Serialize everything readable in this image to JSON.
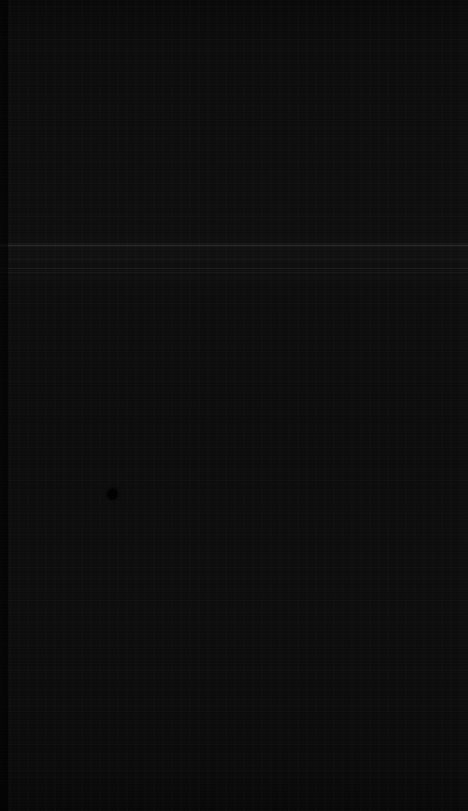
{
  "capture": {
    "width_px": 468,
    "height_px": 811,
    "description": "Near-black screen capture with no legible content",
    "state_label": "",
    "background_color": "#0b0b0b"
  },
  "colors": {
    "background": "#0b0b0b",
    "surface_dark": "#090909",
    "surface_mid": "#0d0d0d",
    "surface_light_band": "#141414",
    "rule_faint": "#1c1c1c",
    "rule_fainter": "#151515",
    "cursor": "#020202",
    "edge_gutter": "#000000"
  },
  "features": {
    "left_gutter": {
      "x": 0,
      "width": 8,
      "label": ""
    },
    "right_edge_band": {
      "x": 461,
      "width": 7,
      "label": ""
    },
    "bright_band": {
      "y": 243,
      "height": 5,
      "label": ""
    },
    "rules": [
      {
        "y": 245,
        "height": 1,
        "color": "#1e1e1e",
        "label": ""
      },
      {
        "y": 268,
        "height": 1,
        "color": "#1a1a1a",
        "label": ""
      },
      {
        "y": 272,
        "height": 1,
        "color": "#181818",
        "label": ""
      },
      {
        "y": 276,
        "height": 1,
        "color": "#131313",
        "label": ""
      },
      {
        "y": 388,
        "height": 1,
        "color": "#111111",
        "label": ""
      },
      {
        "y": 670,
        "height": 1,
        "color": "#121212",
        "label": ""
      },
      {
        "y": 706,
        "height": 1,
        "color": "#111111",
        "label": ""
      },
      {
        "y": 770,
        "height": 1,
        "color": "#121212",
        "label": ""
      }
    ],
    "cursor": {
      "x": 108,
      "y": 489,
      "label": ""
    }
  },
  "text": {
    "visible_strings": [],
    "note": ""
  }
}
